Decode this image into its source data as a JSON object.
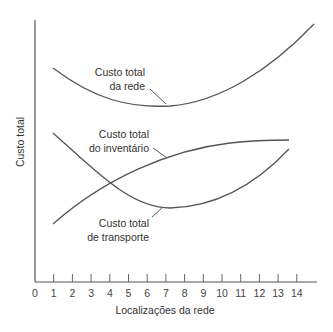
{
  "chart_data": {
    "type": "line",
    "title": "",
    "xlabel": "Localizações da rede",
    "ylabel": "Custo total",
    "x_ticks": [
      0,
      1,
      2,
      3,
      4,
      5,
      6,
      7,
      8,
      9,
      10,
      11,
      12,
      13,
      14
    ],
    "xlim": [
      0,
      15
    ],
    "ylim": [
      0,
      100
    ],
    "y_ticks": [],
    "grid": false,
    "legend": "none (inline labels with leader lines)",
    "series": [
      {
        "name": "Custo total da rede",
        "label_lines": [
          "Custo total",
          "da rede"
        ],
        "shape": "U-shaped, minimum near x=7",
        "points": [
          [
            0.9,
            82
          ],
          [
            3,
            74
          ],
          [
            5,
            69
          ],
          [
            7.1,
            67
          ],
          [
            9,
            70
          ],
          [
            11,
            77
          ],
          [
            13,
            87
          ],
          [
            15,
            98
          ]
        ]
      },
      {
        "name": "Custo total do inventário",
        "label_lines": [
          "Custo total",
          "do inventário"
        ],
        "shape": "increasing, concave",
        "points": [
          [
            0.9,
            22
          ],
          [
            3,
            31
          ],
          [
            5,
            38
          ],
          [
            7,
            44
          ],
          [
            9,
            49
          ],
          [
            11,
            52
          ],
          [
            13.6,
            54
          ]
        ]
      },
      {
        "name": "Custo total de transporte",
        "label_lines": [
          "Custo total",
          "de transporte"
        ],
        "shape": "decreasing then increasing, minimum near x=7",
        "points": [
          [
            0.9,
            54
          ],
          [
            3,
            42
          ],
          [
            5,
            33
          ],
          [
            7.1,
            28
          ],
          [
            9,
            30
          ],
          [
            11,
            37
          ],
          [
            13.6,
            51
          ]
        ]
      }
    ],
    "annotations": [
      {
        "text": "Custo total da rede",
        "points_to": [
          7,
          67
        ]
      },
      {
        "text": "Custo total do inventário",
        "points_to": [
          7,
          47
        ]
      },
      {
        "text": "Custo total de transporte",
        "points_to": [
          6.8,
          28
        ]
      }
    ]
  },
  "labels": {
    "y_axis": "Custo total",
    "x_axis": "Localizações da rede",
    "network_line1": "Custo total",
    "network_line2": "da rede",
    "inventory_line1": "Custo total",
    "inventory_line2": "do inventário",
    "transport_line1": "Custo total",
    "transport_line2": "de transporte"
  },
  "colors": {
    "axis": "#555555",
    "curve": "#555555",
    "text": "#333333"
  }
}
